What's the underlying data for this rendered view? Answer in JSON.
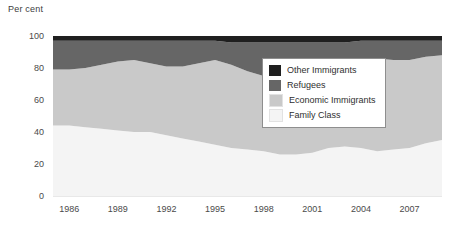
{
  "chart_data": {
    "type": "area",
    "title": "Per cent",
    "subtitle": "",
    "xlabel": "",
    "ylabel": "Per cent",
    "stacked": true,
    "grid": false,
    "legend_position": "inside-right",
    "xlim": [
      1985,
      2009
    ],
    "ylim": [
      0,
      100
    ],
    "y_ticks": [
      0,
      20,
      40,
      60,
      80,
      100
    ],
    "x_ticks": [
      1986,
      1989,
      1992,
      1995,
      1998,
      2001,
      2004,
      2007
    ],
    "x": [
      1985,
      1986,
      1987,
      1988,
      1989,
      1990,
      1991,
      1992,
      1993,
      1994,
      1995,
      1996,
      1997,
      1998,
      1999,
      2000,
      2001,
      2002,
      2003,
      2004,
      2005,
      2006,
      2007,
      2008,
      2009
    ],
    "series": [
      {
        "name": "Family Class",
        "color": "#f4f4f4",
        "values": [
          44,
          44,
          43,
          42,
          41,
          40,
          40,
          38,
          36,
          34,
          32,
          30,
          29,
          28,
          26,
          26,
          27,
          30,
          31,
          30,
          28,
          29,
          30,
          33,
          35
        ]
      },
      {
        "name": "Economic Immigrants",
        "color": "#c9c9c9",
        "values": [
          35,
          35,
          37,
          40,
          43,
          45,
          43,
          43,
          45,
          49,
          53,
          52,
          49,
          47,
          52,
          56,
          57,
          55,
          54,
          56,
          58,
          56,
          55,
          54,
          53
        ]
      },
      {
        "name": "Refugees",
        "color": "#666666",
        "values": [
          18,
          18,
          17,
          15,
          13,
          12,
          14,
          16,
          16,
          14,
          12,
          14,
          18,
          21,
          18,
          14,
          12,
          11,
          11,
          11,
          11,
          12,
          12,
          10,
          9
        ]
      },
      {
        "name": "Other Immigrants",
        "color": "#1f1f1f",
        "values": [
          3,
          3,
          3,
          3,
          3,
          3,
          3,
          3,
          3,
          3,
          3,
          4,
          4,
          4,
          4,
          4,
          4,
          4,
          4,
          3,
          3,
          3,
          3,
          3,
          3
        ]
      }
    ],
    "cumulative_top_boundaries": {
      "family_class_top": [
        44,
        44,
        43,
        42,
        41,
        40,
        40,
        38,
        36,
        34,
        32,
        30,
        29,
        28,
        26,
        26,
        27,
        30,
        31,
        30,
        28,
        29,
        30,
        33,
        35
      ],
      "economic_top": [
        79,
        79,
        80,
        82,
        84,
        85,
        83,
        81,
        81,
        83,
        85,
        82,
        78,
        75,
        78,
        82,
        84,
        85,
        85,
        86,
        86,
        85,
        85,
        87,
        88
      ],
      "refugees_top": [
        97,
        97,
        97,
        97,
        97,
        97,
        97,
        97,
        97,
        97,
        97,
        96,
        96,
        96,
        96,
        96,
        96,
        96,
        96,
        97,
        97,
        97,
        97,
        97,
        97
      ],
      "other_top": [
        100,
        100,
        100,
        100,
        100,
        100,
        100,
        100,
        100,
        100,
        100,
        100,
        100,
        100,
        100,
        100,
        100,
        100,
        100,
        100,
        100,
        100,
        100,
        100,
        100
      ]
    }
  },
  "legend": {
    "items": [
      {
        "label": "Other Immigrants",
        "color": "#1f1f1f",
        "swatch_name": "legend-swatch-other-immigrants"
      },
      {
        "label": "Refugees",
        "color": "#666666",
        "swatch_name": "legend-swatch-refugees"
      },
      {
        "label": "Economic Immigrants",
        "color": "#c9c9c9",
        "swatch_name": "legend-swatch-economic-immigrants"
      },
      {
        "label": "Family Class",
        "color": "#f4f4f4",
        "swatch_name": "legend-swatch-family-class"
      }
    ]
  },
  "colors": {
    "other_immigrants": "#1f1f1f",
    "refugees": "#666666",
    "economic_immigrants": "#c9c9c9",
    "family_class": "#f4f4f4",
    "axis_text": "#4a4a4a",
    "legend_border": "#8e8e8e",
    "background": "#ffffff"
  }
}
